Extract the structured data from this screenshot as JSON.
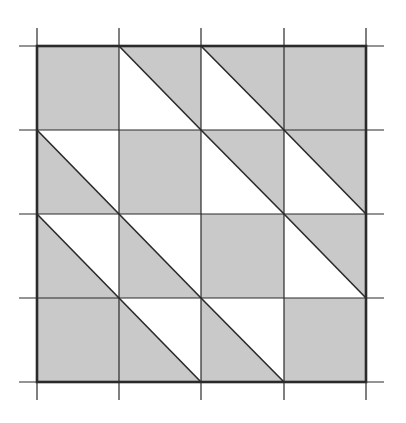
{
  "diagram": {
    "grid": {
      "rows": 4,
      "cols": 4,
      "x_lines": [
        37,
        119,
        201,
        284,
        366
      ],
      "y_lines": [
        46,
        130,
        214,
        298,
        382
      ],
      "tick_overhang": 18
    },
    "colors": {
      "shade": "#c9c9c9",
      "background": "#ffffff",
      "line": "#2a2a2a"
    },
    "cells": [
      {
        "row": 0,
        "col": 0,
        "type": "full"
      },
      {
        "row": 0,
        "col": 1,
        "type": "upper-right"
      },
      {
        "row": 0,
        "col": 2,
        "type": "upper-right"
      },
      {
        "row": 0,
        "col": 3,
        "type": "full"
      },
      {
        "row": 1,
        "col": 0,
        "type": "lower-left"
      },
      {
        "row": 1,
        "col": 1,
        "type": "full"
      },
      {
        "row": 1,
        "col": 2,
        "type": "upper-right"
      },
      {
        "row": 1,
        "col": 3,
        "type": "upper-right"
      },
      {
        "row": 2,
        "col": 0,
        "type": "lower-left"
      },
      {
        "row": 2,
        "col": 1,
        "type": "lower-left"
      },
      {
        "row": 2,
        "col": 2,
        "type": "full"
      },
      {
        "row": 2,
        "col": 3,
        "type": "upper-right"
      },
      {
        "row": 3,
        "col": 0,
        "type": "full"
      },
      {
        "row": 3,
        "col": 1,
        "type": "lower-left"
      },
      {
        "row": 3,
        "col": 2,
        "type": "lower-left"
      },
      {
        "row": 3,
        "col": 3,
        "type": "full"
      }
    ]
  }
}
